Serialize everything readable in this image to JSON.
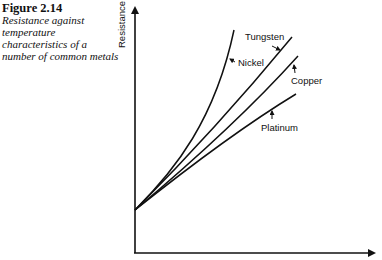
{
  "caption": {
    "figure_number": "Figure 2.14",
    "text": "Resistance against temperature characteristics of a number of common metals"
  },
  "axes": {
    "ylabel": "Resistance",
    "xlabel": ""
  },
  "curves": [
    {
      "name": "Tungsten",
      "label": "Tungsten"
    },
    {
      "name": "Nickel",
      "label": "Nickel"
    },
    {
      "name": "Copper",
      "label": "Copper"
    },
    {
      "name": "Platinum",
      "label": "Platinum"
    }
  ]
}
